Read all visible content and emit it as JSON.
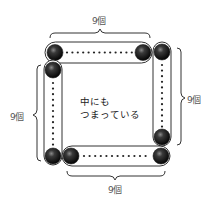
{
  "diagram": {
    "labels": {
      "top": "9個",
      "right": "9個",
      "left": "9個",
      "bottom": "9個"
    },
    "center_text": {
      "line1": "中にも",
      "line2": "つまっている"
    },
    "groups": [
      {
        "side": "top",
        "count": 9
      },
      {
        "side": "right",
        "count": 9
      },
      {
        "side": "bottom",
        "count": 9
      },
      {
        "side": "left",
        "count": 9
      }
    ],
    "colors": {
      "ball": "#1a1a1a",
      "outline": "#333333",
      "text": "#555555"
    }
  }
}
